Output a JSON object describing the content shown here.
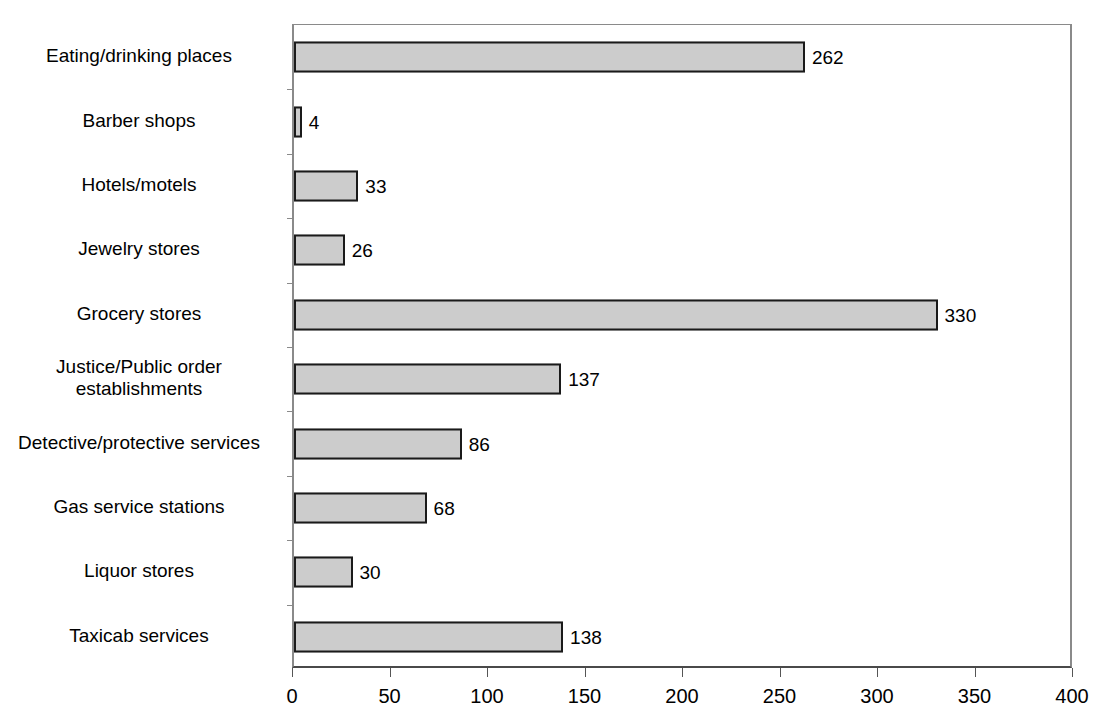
{
  "chart_data": {
    "type": "bar",
    "orientation": "horizontal",
    "title": "",
    "xlabel": "",
    "ylabel": "",
    "xlim": [
      0,
      400
    ],
    "xticks": [
      0,
      50,
      100,
      150,
      200,
      250,
      300,
      350,
      400
    ],
    "grid": false,
    "legend": null,
    "bar_color": "#cccccc",
    "bar_border_color": "#1a1a1a",
    "categories": [
      "Eating/drinking places",
      "Barber shops",
      "Hotels/motels",
      "Jewelry stores",
      "Grocery stores",
      "Justice/Public order\nestablishments",
      "Detective/protective services",
      "Gas service stations",
      "Liquor stores",
      "Taxicab services"
    ],
    "values": [
      262,
      4,
      33,
      26,
      330,
      137,
      86,
      68,
      30,
      138
    ],
    "value_labels": [
      "262",
      "4",
      "33",
      "26",
      "330",
      "137",
      "86",
      "68",
      "30",
      "138"
    ],
    "xtick_labels": [
      "0",
      "50",
      "100",
      "150",
      "200",
      "250",
      "300",
      "350",
      "400"
    ]
  }
}
